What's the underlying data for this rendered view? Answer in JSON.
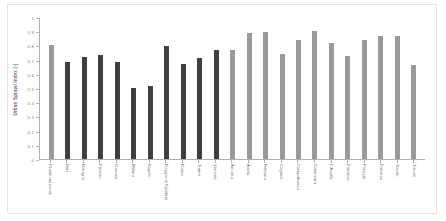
{
  "chart_data": {
    "type": "bar",
    "title": "",
    "xlabel": "",
    "ylabel": "Urban Sprawl Index [-]",
    "ylim": [
      0,
      1
    ],
    "yticks": [
      "0",
      "0.1",
      "0.2",
      "0.3",
      "0.4",
      "0.5",
      "0.6",
      "0.7",
      "0.8",
      "0.9",
      "1"
    ],
    "grid": false,
    "legend": "none",
    "categories": [
      "Provincial mean",
      "Bari",
      "Bologna",
      "Firenze",
      "Genova",
      "Milano",
      "Napoli",
      "Reggio di Calabria",
      "Roma",
      "Torino",
      "Venezia",
      "Ancona",
      "Aosta",
      "Bolzano",
      "Cagliari",
      "Campobasso",
      "Catanzaro",
      "L'Aquila",
      "Palermo",
      "Perugia",
      "Potenza",
      "Trento",
      "Trieste"
    ],
    "values": [
      0.81,
      0.69,
      0.725,
      0.735,
      0.69,
      0.505,
      0.515,
      0.805,
      0.675,
      0.715,
      0.77,
      0.775,
      0.895,
      0.9,
      0.745,
      0.845,
      0.905,
      0.825,
      0.73,
      0.845,
      0.875,
      0.87,
      0.665
    ],
    "bar_colors": [
      "#9a9a9a",
      "#3f3f3f",
      "#3f3f3f",
      "#3f3f3f",
      "#3f3f3f",
      "#3f3f3f",
      "#3f3f3f",
      "#3f3f3f",
      "#3f3f3f",
      "#3f3f3f",
      "#3f3f3f",
      "#9a9a9a",
      "#9a9a9a",
      "#9a9a9a",
      "#9a9a9a",
      "#9a9a9a",
      "#9a9a9a",
      "#9a9a9a",
      "#9a9a9a",
      "#9a9a9a",
      "#9a9a9a",
      "#9a9a9a",
      "#9a9a9a"
    ]
  },
  "colors": {
    "mean_bar": "#9a9a9a",
    "major_city_bar": "#3f3f3f",
    "capital_bar": "#9a9a9a",
    "axis": "#b0b0b0",
    "text": "#6e6e6e",
    "frame": "#e3e3e3",
    "background": "#ffffff"
  }
}
